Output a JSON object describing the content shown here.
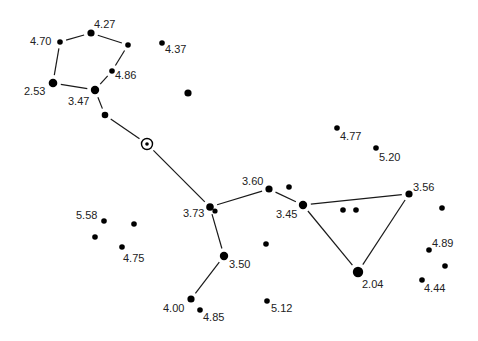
{
  "diagram": {
    "type": "star-chart",
    "background": "#ffffff",
    "ink_color": "#000000",
    "label_color": "#222222",
    "line_width": 1.2,
    "center_marker": {
      "name": "center-marker",
      "x": 147,
      "y": 144,
      "r_outer": 5.5,
      "r_inner": 1.8
    },
    "stars": [
      {
        "id": "s1",
        "x": 60,
        "y": 42,
        "r": 2.8,
        "label": "4.70",
        "lx": 30,
        "ly": 45,
        "anchor": "start"
      },
      {
        "id": "s2",
        "x": 91,
        "y": 33,
        "r": 3.6,
        "label": "4.27",
        "lx": 94,
        "ly": 28,
        "anchor": "start"
      },
      {
        "id": "s3",
        "x": 128,
        "y": 45,
        "r": 2.8,
        "label": "",
        "lx": 0,
        "ly": 0,
        "anchor": "start"
      },
      {
        "id": "s4",
        "x": 112,
        "y": 71,
        "r": 2.8,
        "label": "4.86",
        "lx": 115,
        "ly": 79,
        "anchor": "start"
      },
      {
        "id": "s5",
        "x": 53,
        "y": 83,
        "r": 4.3,
        "label": "2.53",
        "lx": 24,
        "ly": 95,
        "anchor": "start"
      },
      {
        "id": "s6",
        "x": 95,
        "y": 90,
        "r": 4.2,
        "label": "3.47",
        "lx": 68,
        "ly": 105,
        "anchor": "start"
      },
      {
        "id": "s7",
        "x": 105,
        "y": 115,
        "r": 3.3,
        "label": "",
        "lx": 0,
        "ly": 0,
        "anchor": "start"
      },
      {
        "id": "s8",
        "x": 162,
        "y": 43,
        "r": 2.8,
        "label": "4.37",
        "lx": 165,
        "ly": 53,
        "anchor": "start"
      },
      {
        "id": "s9",
        "x": 188,
        "y": 93,
        "r": 3.6,
        "label": "",
        "lx": 0,
        "ly": 0,
        "anchor": "start"
      },
      {
        "id": "s10",
        "x": 210,
        "y": 207,
        "r": 3.8,
        "label": "3.73",
        "lx": 183,
        "ly": 217,
        "anchor": "start"
      },
      {
        "id": "s11",
        "x": 215,
        "y": 211,
        "r": 2.6,
        "label": "",
        "lx": 0,
        "ly": 0,
        "anchor": "start"
      },
      {
        "id": "s12",
        "x": 269,
        "y": 189,
        "r": 3.6,
        "label": "3.60",
        "lx": 242,
        "ly": 185,
        "anchor": "start"
      },
      {
        "id": "s13",
        "x": 289,
        "y": 187,
        "r": 2.8,
        "label": "",
        "lx": 0,
        "ly": 0,
        "anchor": "start"
      },
      {
        "id": "s14",
        "x": 303,
        "y": 205,
        "r": 4.2,
        "label": "3.45",
        "lx": 276,
        "ly": 218,
        "anchor": "start"
      },
      {
        "id": "s15",
        "x": 343,
        "y": 210,
        "r": 2.8,
        "label": "",
        "lx": 0,
        "ly": 0,
        "anchor": "start"
      },
      {
        "id": "s16",
        "x": 356,
        "y": 210,
        "r": 2.8,
        "label": "",
        "lx": 0,
        "ly": 0,
        "anchor": "start"
      },
      {
        "id": "s17",
        "x": 409,
        "y": 194,
        "r": 3.6,
        "label": "3.56",
        "lx": 413,
        "ly": 191,
        "anchor": "start"
      },
      {
        "id": "s18",
        "x": 358,
        "y": 272,
        "r": 5.2,
        "label": "2.04",
        "lx": 362,
        "ly": 288,
        "anchor": "start"
      },
      {
        "id": "s19",
        "x": 266,
        "y": 244,
        "r": 2.8,
        "label": "",
        "lx": 0,
        "ly": 0,
        "anchor": "start"
      },
      {
        "id": "s20",
        "x": 224,
        "y": 256,
        "r": 4.2,
        "label": "3.50",
        "lx": 229,
        "ly": 268,
        "anchor": "start"
      },
      {
        "id": "s21",
        "x": 191,
        "y": 299,
        "r": 3.6,
        "label": "4.00",
        "lx": 163,
        "ly": 312,
        "anchor": "start"
      },
      {
        "id": "s22",
        "x": 200,
        "y": 310,
        "r": 2.8,
        "label": "4.85",
        "lx": 203,
        "ly": 321,
        "anchor": "start"
      },
      {
        "id": "s23",
        "x": 267,
        "y": 301,
        "r": 2.8,
        "label": "5.12",
        "lx": 271,
        "ly": 312,
        "anchor": "start"
      },
      {
        "id": "s24",
        "x": 337,
        "y": 128,
        "r": 2.8,
        "label": "4.77",
        "lx": 340,
        "ly": 140,
        "anchor": "start"
      },
      {
        "id": "s25",
        "x": 376,
        "y": 148,
        "r": 2.8,
        "label": "5.20",
        "lx": 379,
        "ly": 161,
        "anchor": "start"
      },
      {
        "id": "s26",
        "x": 442,
        "y": 208,
        "r": 2.8,
        "label": "",
        "lx": 0,
        "ly": 0,
        "anchor": "start"
      },
      {
        "id": "s27",
        "x": 429,
        "y": 250,
        "r": 2.8,
        "label": "4.89",
        "lx": 432,
        "ly": 247,
        "anchor": "start"
      },
      {
        "id": "s28",
        "x": 445,
        "y": 266,
        "r": 2.8,
        "label": "",
        "lx": 0,
        "ly": 0,
        "anchor": "start"
      },
      {
        "id": "s29",
        "x": 422,
        "y": 280,
        "r": 2.8,
        "label": "4.44",
        "lx": 424,
        "ly": 292,
        "anchor": "start"
      },
      {
        "id": "s30",
        "x": 104,
        "y": 221,
        "r": 2.8,
        "label": "5.58",
        "lx": 76,
        "ly": 219,
        "anchor": "start"
      },
      {
        "id": "s31",
        "x": 134,
        "y": 224,
        "r": 2.8,
        "label": "",
        "lx": 0,
        "ly": 0,
        "anchor": "start"
      },
      {
        "id": "s32",
        "x": 95,
        "y": 237,
        "r": 2.8,
        "label": "",
        "lx": 0,
        "ly": 0,
        "anchor": "start"
      },
      {
        "id": "s33",
        "x": 122,
        "y": 247,
        "r": 2.8,
        "label": "4.75",
        "lx": 123,
        "ly": 262,
        "anchor": "start"
      }
    ],
    "lines": [
      {
        "from": "s1",
        "to": "s2"
      },
      {
        "from": "s2",
        "to": "s3"
      },
      {
        "from": "s3",
        "to": "s4"
      },
      {
        "from": "s4",
        "to": "s6"
      },
      {
        "from": "s6",
        "to": "s5"
      },
      {
        "from": "s5",
        "to": "s1"
      },
      {
        "from": "s6",
        "to": "s7"
      },
      {
        "from": "s7",
        "to": "center"
      },
      {
        "from": "center",
        "to": "s10"
      },
      {
        "from": "s10",
        "to": "s12"
      },
      {
        "from": "s12",
        "to": "s14"
      },
      {
        "from": "s14",
        "to": "s17"
      },
      {
        "from": "s17",
        "to": "s18"
      },
      {
        "from": "s18",
        "to": "s14"
      },
      {
        "from": "s10",
        "to": "s20"
      },
      {
        "from": "s20",
        "to": "s21"
      }
    ],
    "gap": 6
  }
}
